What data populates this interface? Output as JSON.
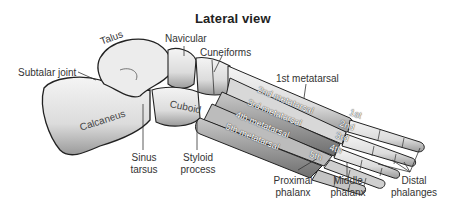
{
  "title": "Lateral view",
  "labels": {
    "talus": "Talus",
    "navicular": "Navicular",
    "cuneiforms": "Cuneiforms",
    "subtalar_joint": "Subtalar joint",
    "calcaneus": "Calcaneus",
    "cuboid": "Cuboid",
    "sinus_tarsus_1": "Sinus",
    "sinus_tarsus_2": "tarsus",
    "styloid_process_1": "Styloid",
    "styloid_process_2": "process",
    "first_metatarsal": "1st metatarsal",
    "proximal_phalanx_1": "Proximal",
    "proximal_phalanx_2": "phalanx",
    "middle_phalanx_1": "Middle",
    "middle_phalanx_2": "phalanx",
    "distal_phalanges_1": "Distal",
    "distal_phalanges_2": "phalanges"
  },
  "bone_labels": {
    "metatarsal_2": "2nd metatarsal",
    "metatarsal_3": "3rd metatarsal",
    "metatarsal_4": "4th metatarsal",
    "metatarsal_5": "5th metatarsal",
    "toe_1": "1st",
    "toe_2": "2nd",
    "toe_3": "3rd",
    "toe_4": "4th",
    "toe_5": "5th"
  }
}
